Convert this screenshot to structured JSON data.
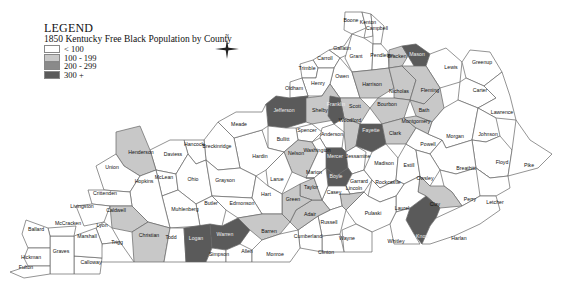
{
  "legend": {
    "title": "LEGEND",
    "subtitle": "1850 Kentucky Free Black Population by County",
    "classes": [
      {
        "label": "< 100",
        "color": "#ffffff"
      },
      {
        "label": "100 - 199",
        "color": "#c8c8c8"
      },
      {
        "label": "200 - 299",
        "color": "#8a8a8a"
      },
      {
        "label": "300 +",
        "color": "#5a5a5a"
      }
    ]
  },
  "compass": {
    "label": "N"
  },
  "counties": [
    {
      "name": "Boone",
      "cls": 0
    },
    {
      "name": "Kenton",
      "cls": 0
    },
    {
      "name": "Campbell",
      "cls": 0
    },
    {
      "name": "Gallatin",
      "cls": 0
    },
    {
      "name": "Carroll",
      "cls": 0
    },
    {
      "name": "Trimble",
      "cls": 0
    },
    {
      "name": "Grant",
      "cls": 0
    },
    {
      "name": "Pendleton",
      "cls": 0
    },
    {
      "name": "Bracken",
      "cls": 1
    },
    {
      "name": "Mason",
      "cls": 3
    },
    {
      "name": "Lewis",
      "cls": 0
    },
    {
      "name": "Greenup",
      "cls": 0
    },
    {
      "name": "Carter",
      "cls": 0
    },
    {
      "name": "Lawrence",
      "cls": 0
    },
    {
      "name": "Owen",
      "cls": 0
    },
    {
      "name": "Henry",
      "cls": 0
    },
    {
      "name": "Oldham",
      "cls": 0
    },
    {
      "name": "Harrison",
      "cls": 1
    },
    {
      "name": "Nicholas",
      "cls": 1
    },
    {
      "name": "Fleming",
      "cls": 1
    },
    {
      "name": "Bath",
      "cls": 1
    },
    {
      "name": "Scott",
      "cls": 1
    },
    {
      "name": "Bourbon",
      "cls": 1
    },
    {
      "name": "Jefferson",
      "cls": 3
    },
    {
      "name": "Shelby",
      "cls": 1
    },
    {
      "name": "Franklin",
      "cls": 3
    },
    {
      "name": "Woodford",
      "cls": 1
    },
    {
      "name": "Fayette",
      "cls": 3
    },
    {
      "name": "Clark",
      "cls": 1
    },
    {
      "name": "Montgomery",
      "cls": 1
    },
    {
      "name": "Spencer",
      "cls": 0
    },
    {
      "name": "Anderson",
      "cls": 0
    },
    {
      "name": "Bullitt",
      "cls": 0
    },
    {
      "name": "Nelson",
      "cls": 1
    },
    {
      "name": "Mercer",
      "cls": 3
    },
    {
      "name": "Jessamine",
      "cls": 0
    },
    {
      "name": "Washington",
      "cls": 0
    },
    {
      "name": "Boyle",
      "cls": 3
    },
    {
      "name": "Garrard",
      "cls": 0
    },
    {
      "name": "Madison",
      "cls": 0
    },
    {
      "name": "Estill",
      "cls": 0
    },
    {
      "name": "Powell",
      "cls": 0
    },
    {
      "name": "Morgan",
      "cls": 0
    },
    {
      "name": "Johnson",
      "cls": 0
    },
    {
      "name": "Floyd",
      "cls": 0
    },
    {
      "name": "Pike",
      "cls": 0
    },
    {
      "name": "Breathitt",
      "cls": 0
    },
    {
      "name": "Owsley",
      "cls": 0
    },
    {
      "name": "Perry",
      "cls": 0
    },
    {
      "name": "Letcher",
      "cls": 0
    },
    {
      "name": "Clay",
      "cls": 1
    },
    {
      "name": "Knox",
      "cls": 3
    },
    {
      "name": "Harlan",
      "cls": 0
    },
    {
      "name": "Laurel",
      "cls": 0
    },
    {
      "name": "Whitley",
      "cls": 0
    },
    {
      "name": "Rockcastle",
      "cls": 0
    },
    {
      "name": "Pulaski",
      "cls": 0
    },
    {
      "name": "Lincoln",
      "cls": 1
    },
    {
      "name": "Casey",
      "cls": 0
    },
    {
      "name": "Wayne",
      "cls": 0
    },
    {
      "name": "Clinton",
      "cls": 0
    },
    {
      "name": "Russell",
      "cls": 0
    },
    {
      "name": "Cumberland",
      "cls": 0
    },
    {
      "name": "Adair",
      "cls": 1
    },
    {
      "name": "Taylor",
      "cls": 1
    },
    {
      "name": "Green",
      "cls": 1
    },
    {
      "name": "Marion",
      "cls": 0
    },
    {
      "name": "Larue",
      "cls": 0
    },
    {
      "name": "Hardin",
      "cls": 0
    },
    {
      "name": "Meade",
      "cls": 0
    },
    {
      "name": "Breckinridge",
      "cls": 0
    },
    {
      "name": "Hancock",
      "cls": 0
    },
    {
      "name": "Daviess",
      "cls": 0
    },
    {
      "name": "Henderson",
      "cls": 1
    },
    {
      "name": "Union",
      "cls": 0
    },
    {
      "name": "McLean",
      "cls": 0
    },
    {
      "name": "Ohio",
      "cls": 0
    },
    {
      "name": "Grayson",
      "cls": 0
    },
    {
      "name": "Hart",
      "cls": 0
    },
    {
      "name": "Edmonson",
      "cls": 0
    },
    {
      "name": "Butler",
      "cls": 0
    },
    {
      "name": "Muhlenberg",
      "cls": 0
    },
    {
      "name": "Hopkins",
      "cls": 0
    },
    {
      "name": "Crittenden",
      "cls": 0
    },
    {
      "name": "Livingston",
      "cls": 0
    },
    {
      "name": "Caldwell",
      "cls": 1
    },
    {
      "name": "Lyon",
      "cls": 0
    },
    {
      "name": "Christian",
      "cls": 1
    },
    {
      "name": "Todd",
      "cls": 0
    },
    {
      "name": "Logan",
      "cls": 3
    },
    {
      "name": "Warren",
      "cls": 3
    },
    {
      "name": "Simpson",
      "cls": 0
    },
    {
      "name": "Allen",
      "cls": 0
    },
    {
      "name": "Barren",
      "cls": 1
    },
    {
      "name": "Monroe",
      "cls": 0
    },
    {
      "name": "Trigg",
      "cls": 0
    },
    {
      "name": "Calloway",
      "cls": 0
    },
    {
      "name": "Marshall",
      "cls": 0
    },
    {
      "name": "Graves",
      "cls": 0
    },
    {
      "name": "McCracken",
      "cls": 0
    },
    {
      "name": "Ballard",
      "cls": 0
    },
    {
      "name": "Hickman",
      "cls": 0
    },
    {
      "name": "Fulton",
      "cls": 0
    }
  ]
}
